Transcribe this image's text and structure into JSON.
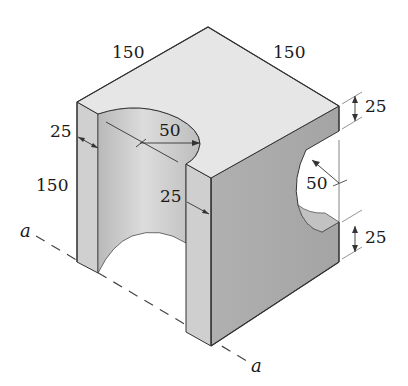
{
  "figure": {
    "type": "isometric-solid",
    "colors": {
      "top_face": "#e4e4e4",
      "left_face": "#d2d2d2",
      "right_face": "#a9a9a9",
      "cutout_inner": "#c8c8c8",
      "edge": "#333333",
      "dimension_line": "#555555"
    }
  },
  "dimensions": {
    "top_left_edge": "150",
    "top_right_edge": "150",
    "left_wall_thickness": "25",
    "left_height": "150",
    "cutout_radius_top": "50",
    "front_wall_thickness": "25",
    "right_top_thickness": "25",
    "right_cutout_radius": "50",
    "right_bottom_thickness": "25"
  },
  "axis": {
    "label_left": "a",
    "label_right": "a"
  }
}
